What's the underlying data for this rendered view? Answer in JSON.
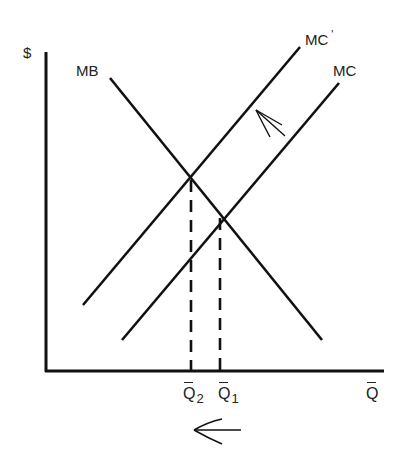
{
  "diagram": {
    "type": "marginal-cost-benefit",
    "axes": {
      "y_label": "$",
      "x_label": "Q",
      "x_label_has_bar": true
    },
    "curves": [
      {
        "id": "mb",
        "label": "MB",
        "slope": "downward"
      },
      {
        "id": "mc",
        "label": "MC",
        "slope": "upward"
      },
      {
        "id": "mc_prime",
        "label": "MC",
        "prime": "'",
        "slope": "upward"
      }
    ],
    "quantities": [
      {
        "id": "q2",
        "label": "Q",
        "subscript": "2",
        "note": "intersection of MB and MC'"
      },
      {
        "id": "q1",
        "label": "Q",
        "subscript": "1",
        "note": "intersection of MB and MC"
      }
    ],
    "annotations": [
      {
        "id": "shift-arrow",
        "direction": "up-left",
        "meaning": "MC shifts to MC'"
      },
      {
        "id": "quantity-arrow",
        "direction": "left",
        "meaning": "Q decreases from Q1 to Q2"
      }
    ],
    "colors": {
      "line": "#111111",
      "text": "#222222",
      "background": "#ffffff"
    }
  }
}
